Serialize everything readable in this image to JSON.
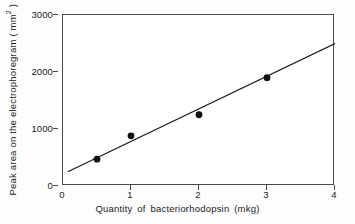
{
  "chart_data": {
    "type": "scatter",
    "title": "",
    "subtitle": "",
    "xlabel": "Quantity of  bacteriorhodopsin (mkg)",
    "ylabel_text": "Peak area on the electrophoregram ( mm",
    "ylabel_sup": "2",
    "ylabel_tail": " )",
    "ylabel_full": "Peak area on the electrophoregram ( mm2 )",
    "xlim": [
      0,
      4
    ],
    "ylim": [
      0,
      3000
    ],
    "xticks": [
      0,
      1,
      2,
      3,
      4
    ],
    "xtick_labels": [
      "0",
      "1",
      "2",
      "3",
      "4"
    ],
    "yticks": [
      0,
      1000,
      2000,
      3000
    ],
    "ytick_labels": [
      "0",
      "1000",
      "2000",
      "3000"
    ],
    "grid": false,
    "legend": null,
    "x": [
      0.5,
      1.0,
      2.0,
      3.0
    ],
    "values": [
      470,
      880,
      1250,
      1900
    ],
    "points": [
      {
        "x": 0.5,
        "y": 470
      },
      {
        "x": 1.0,
        "y": 880
      },
      {
        "x": 2.0,
        "y": 1250
      },
      {
        "x": 3.0,
        "y": 1900
      }
    ],
    "series": [
      {
        "name": "Peak area",
        "type": "scatter",
        "marker": "filled-circle",
        "color": "#111111",
        "x": [
          0.5,
          1.0,
          2.0,
          3.0
        ],
        "values": [
          470,
          880,
          1250,
          1900
        ]
      },
      {
        "name": "Fitted line",
        "type": "line",
        "color": "#1b1b1b",
        "x": [
          0.07,
          4.0
        ],
        "values": [
          250,
          2500
        ]
      }
    ],
    "fit_line": {
      "x_start": 0.07,
      "y_start": 250,
      "x_end": 4.0,
      "y_end": 2500,
      "slope": 573,
      "intercept": 210
    },
    "annotations": []
  },
  "figure": {
    "background_color": "#fdfdfd",
    "plot_background_color": "#ffffff",
    "axis_color": "#4a4a4a",
    "text_color": "#1b1b1b",
    "marker_color": "#111111"
  }
}
